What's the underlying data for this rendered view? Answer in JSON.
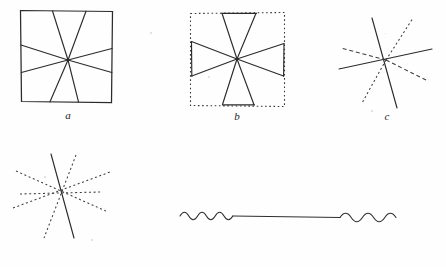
{
  "page": {
    "background_color": "#ffffff",
    "ink_color": "#2b2b2b",
    "width": 446,
    "height": 267
  },
  "figures": [
    {
      "id": "a",
      "caption": "a",
      "description": "Hering-type figure: solid square frame with eight solid rays converging on an off-center point",
      "style": "solid-frame-solid-rays",
      "frame": {
        "type": "square",
        "stroke": "solid",
        "x": 20,
        "y": 10,
        "width": 92,
        "height": 92
      },
      "center": {
        "x": 68,
        "y": 60
      },
      "ray_angles_deg": [
        100,
        118,
        167,
        193,
        248,
        262,
        283,
        350
      ],
      "caption_pos": {
        "x": 68,
        "y": 118
      }
    },
    {
      "id": "b",
      "caption": "b",
      "description": "Square frame drawn with dotted stroke plus four solid bowtie wedges meeting at center",
      "style": "dotted-frame-solid-rays",
      "frame": {
        "type": "square",
        "stroke": "dotted",
        "x": 190,
        "y": 12,
        "width": 94,
        "height": 94
      },
      "center": {
        "x": 237,
        "y": 59
      },
      "ray_angles_deg": [
        97,
        118,
        172,
        188,
        250,
        263,
        290,
        355
      ],
      "caption_pos": {
        "x": 237,
        "y": 118
      }
    },
    {
      "id": "c",
      "caption": "c",
      "description": "Star of six rays without frame: two long solid lines crossing, remaining rays dotted or dashed",
      "style": "no-frame-mixed-rays",
      "center": {
        "x": 386,
        "y": 60
      },
      "rays": [
        {
          "angle_deg": 100,
          "stroke": "solid",
          "length": 52
        },
        {
          "angle_deg": 280,
          "stroke": "solid",
          "length": 48
        },
        {
          "angle_deg": 5,
          "stroke": "solid",
          "length": 48
        },
        {
          "angle_deg": 185,
          "stroke": "solid",
          "length": 48
        },
        {
          "angle_deg": 60,
          "stroke": "dotted",
          "length": 48
        },
        {
          "angle_deg": 240,
          "stroke": "dotted",
          "length": 48
        },
        {
          "angle_deg": 145,
          "stroke": "dotted",
          "length": 44
        },
        {
          "angle_deg": 325,
          "stroke": "dotted",
          "length": 44
        }
      ],
      "caption_pos": {
        "x": 386,
        "y": 118
      }
    },
    {
      "id": "d",
      "caption": "d",
      "description": "Star of rays without frame: a single solid line, all other rays dotted",
      "style": "no-frame-one-solid-ray",
      "center": {
        "x": 62,
        "y": 196
      },
      "rays": [
        {
          "angle_deg": 103,
          "stroke": "solid",
          "length": 50
        },
        {
          "angle_deg": 283,
          "stroke": "solid",
          "length": 50
        },
        {
          "angle_deg": 60,
          "stroke": "dotted",
          "length": 50
        },
        {
          "angle_deg": 240,
          "stroke": "dotted",
          "length": 50
        },
        {
          "angle_deg": 8,
          "stroke": "dotted",
          "length": 46
        },
        {
          "angle_deg": 188,
          "stroke": "dotted",
          "length": 46
        },
        {
          "angle_deg": 152,
          "stroke": "dotted",
          "length": 45
        },
        {
          "angle_deg": 332,
          "stroke": "dotted",
          "length": 45
        },
        {
          "angle_deg": 170,
          "stroke": "dotted",
          "length": 44
        },
        {
          "angle_deg": 350,
          "stroke": "dotted",
          "length": 44
        }
      ],
      "caption_pos": {
        "x": 62,
        "y": 254
      }
    },
    {
      "id": "e",
      "caption": "e",
      "description": "Long horizontal straight line whose two end segments are drawn as sine waves",
      "style": "straight-line-with-wavy-ends",
      "line": {
        "x1": 180,
        "y1": 215,
        "x2": 396,
        "y2": 217
      },
      "wave_left": {
        "start_x": 180,
        "end_x": 233,
        "amplitude": 4,
        "cycles": 6
      },
      "wave_right": {
        "start_x": 340,
        "end_x": 396,
        "amplitude": 4.5,
        "cycles": 5
      },
      "caption_pos": {
        "x": 294,
        "y": 252
      }
    }
  ]
}
